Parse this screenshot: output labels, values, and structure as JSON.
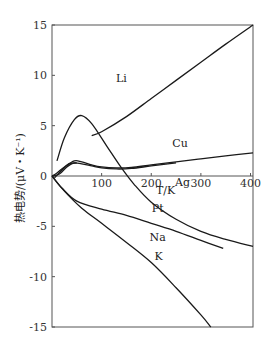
{
  "chart_data": {
    "type": "line",
    "title": "",
    "xlabel": "T/K",
    "ylabel": "热电势/(μV・K⁻¹)",
    "xlim": [
      0,
      405
    ],
    "ylim": [
      -15,
      15
    ],
    "xticks": [
      100,
      200,
      300,
      400
    ],
    "yticks": [
      15,
      10,
      5,
      0,
      -5,
      -10,
      -15
    ],
    "grid": false,
    "legend": "inline curve labels",
    "series": [
      {
        "name": "Li",
        "label_pos": [
          140,
          9.3
        ],
        "points": [
          [
            80,
            4.0
          ],
          [
            100,
            4.4
          ],
          [
            150,
            5.9
          ],
          [
            200,
            7.7
          ],
          [
            250,
            9.5
          ],
          [
            300,
            11.3
          ],
          [
            350,
            13.1
          ],
          [
            405,
            15.0
          ]
        ]
      },
      {
        "name": "Cu",
        "label_pos": [
          258,
          2.9
        ],
        "points": [
          [
            0,
            0
          ],
          [
            10,
            0.3
          ],
          [
            25,
            0.9
          ],
          [
            45,
            1.5
          ],
          [
            60,
            1.4
          ],
          [
            80,
            1.1
          ],
          [
            100,
            0.9
          ],
          [
            130,
            0.8
          ],
          [
            160,
            0.85
          ],
          [
            200,
            1.1
          ],
          [
            250,
            1.4
          ],
          [
            300,
            1.7
          ],
          [
            350,
            2.0
          ],
          [
            405,
            2.3
          ]
        ]
      },
      {
        "name": "Ag",
        "label_pos": [
          263,
          -1.0
        ],
        "points": [
          [
            0,
            0
          ],
          [
            15,
            0.2
          ],
          [
            30,
            0.9
          ],
          [
            45,
            1.3
          ],
          [
            60,
            1.2
          ],
          [
            80,
            1.0
          ],
          [
            100,
            0.8
          ],
          [
            130,
            0.7
          ],
          [
            160,
            0.75
          ],
          [
            200,
            1.0
          ],
          [
            250,
            1.3
          ]
        ]
      },
      {
        "name": "Pt",
        "label_pos": [
          213,
          -3.6
        ],
        "points": [
          [
            10,
            1.5
          ],
          [
            25,
            3.8
          ],
          [
            45,
            5.6
          ],
          [
            60,
            6.0
          ],
          [
            80,
            5.2
          ],
          [
            110,
            3.0
          ],
          [
            140,
            0.8
          ],
          [
            165,
            -0.8
          ],
          [
            200,
            -2.6
          ],
          [
            250,
            -4.3
          ],
          [
            300,
            -5.5
          ],
          [
            350,
            -6.3
          ],
          [
            405,
            -7.0
          ]
        ]
      },
      {
        "name": "Na",
        "label_pos": [
          213,
          -6.5
        ],
        "points": [
          [
            0,
            0
          ],
          [
            20,
            -1.2
          ],
          [
            50,
            -2.5
          ],
          [
            100,
            -3.3
          ],
          [
            150,
            -3.9
          ],
          [
            200,
            -4.7
          ],
          [
            250,
            -5.5
          ],
          [
            300,
            -6.4
          ],
          [
            345,
            -7.2
          ]
        ]
      },
      {
        "name": "K",
        "label_pos": [
          215,
          -8.3
        ],
        "points": [
          [
            0,
            0
          ],
          [
            25,
            -1.5
          ],
          [
            60,
            -3.2
          ],
          [
            100,
            -4.7
          ],
          [
            150,
            -6.6
          ],
          [
            200,
            -8.6
          ],
          [
            250,
            -11.1
          ],
          [
            300,
            -13.8
          ],
          [
            320,
            -15.0
          ]
        ]
      },
      {
        "name": "lowT-branch",
        "label_pos": null,
        "points": [
          [
            5,
            -0.2
          ],
          [
            20,
            0.6
          ],
          [
            35,
            1.2
          ],
          [
            50,
            1.3
          ]
        ]
      }
    ]
  },
  "axes": {
    "ylabel": "热电势/(μV・K⁻¹)",
    "xlabel": "T/K",
    "xtick_labels": [
      "100",
      "200",
      "300",
      "400"
    ],
    "ytick_labels": [
      "15",
      "10",
      "5",
      "0",
      "-5",
      "-10",
      "-15"
    ]
  }
}
